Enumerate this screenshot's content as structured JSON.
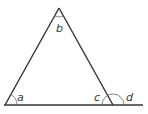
{
  "diagram": {
    "line_color": "#333333",
    "arc_color": "#555555",
    "vertices": {
      "apex": [
        59,
        8
      ],
      "bottom_left": [
        5,
        105
      ],
      "bottom_right": [
        113,
        105
      ]
    },
    "baseline_extension_end": [
      143,
      105
    ],
    "angle_labels": {
      "a": "a",
      "b": "b",
      "c": "c",
      "d": "d"
    }
  }
}
